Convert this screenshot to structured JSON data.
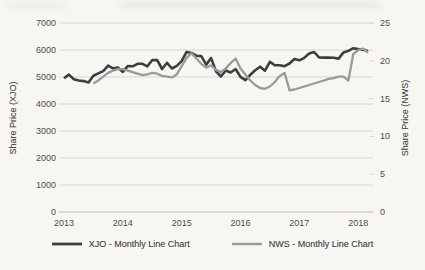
{
  "page": {
    "background": "#f7f6f3"
  },
  "colors": {
    "grid": "#d7d6d2",
    "axis_line": "#bdbcb8",
    "tick_text": "#4d4d4d",
    "xjo_line": "#3e3e3e",
    "nws_line": "#9b9a98"
  },
  "chart_data": {
    "type": "line",
    "title": "",
    "categories": [
      "Jan 2013",
      "Feb 2013",
      "Mar 2013",
      "Apr 2013",
      "May 2013",
      "Jun 2013",
      "Jul 2013",
      "Aug 2013",
      "Sep 2013",
      "Oct 2013",
      "Nov 2013",
      "Dec 2013",
      "Jan 2014",
      "Feb 2014",
      "Mar 2014",
      "Apr 2014",
      "May 2014",
      "Jun 2014",
      "Jul 2014",
      "Aug 2014",
      "Sep 2014",
      "Oct 2014",
      "Nov 2014",
      "Dec 2014",
      "Jan 2015",
      "Feb 2015",
      "Mar 2015",
      "Apr 2015",
      "May 2015",
      "Jun 2015",
      "Jul 2015",
      "Aug 2015",
      "Sep 2015",
      "Oct 2015",
      "Nov 2015",
      "Dec 2015",
      "Jan 2016",
      "Feb 2016",
      "Mar 2016",
      "Apr 2016",
      "May 2016",
      "Jun 2016",
      "Jul 2016",
      "Aug 2016",
      "Sep 2016",
      "Oct 2016",
      "Nov 2016",
      "Dec 2016",
      "Jan 2017",
      "Feb 2017",
      "Mar 2017",
      "Apr 2017",
      "May 2017",
      "Jun 2017",
      "Jul 2017",
      "Aug 2017",
      "Sep 2017",
      "Oct 2017",
      "Nov 2017",
      "Dec 2017",
      "Jan 2018",
      "Feb 2018",
      "Mar 2018"
    ],
    "series": [
      {
        "name": "XJO - Monthly Line Chart",
        "axis": "left",
        "color": "#3e3e3e",
        "stroke_width": 2.6,
        "values": [
          4950,
          5090,
          4920,
          4870,
          4850,
          4800,
          5050,
          5135,
          5220,
          5420,
          5320,
          5350,
          5190,
          5405,
          5395,
          5490,
          5490,
          5395,
          5630,
          5625,
          5295,
          5525,
          5315,
          5410,
          5590,
          5930,
          5890,
          5790,
          5775,
          5460,
          5700,
          5210,
          5020,
          5240,
          5165,
          5295,
          5005,
          4880,
          5080,
          5250,
          5380,
          5235,
          5560,
          5435,
          5435,
          5400,
          5500,
          5665,
          5620,
          5710,
          5865,
          5925,
          5725,
          5720,
          5720,
          5715,
          5680,
          5910,
          5970,
          6065,
          6035,
          6015,
          5950
        ]
      },
      {
        "name": "NWS - Monthly Line Chart",
        "axis": "right",
        "color": "#9b9a98",
        "stroke_width": 2.3,
        "values": [
          null,
          null,
          null,
          null,
          null,
          null,
          17.0,
          17.4,
          17.9,
          18.4,
          18.7,
          18.9,
          18.9,
          18.7,
          18.5,
          18.3,
          18.1,
          18.2,
          18.4,
          18.3,
          18.0,
          17.9,
          17.8,
          18.2,
          19.3,
          20.4,
          21.0,
          20.3,
          19.6,
          19.1,
          19.4,
          18.8,
          18.5,
          19.0,
          19.7,
          20.3,
          19.0,
          18.2,
          17.4,
          16.8,
          16.4,
          16.3,
          16.6,
          17.2,
          18.0,
          18.4,
          16.1,
          16.2,
          16.4,
          16.6,
          16.8,
          17.0,
          17.2,
          17.4,
          17.6,
          17.7,
          17.9,
          17.9,
          17.4,
          20.9,
          21.4,
          21.6,
          21.1
        ]
      }
    ],
    "left_axis": {
      "title": "Share Price (XJO)",
      "min": 0,
      "max": 7000,
      "ticks": [
        0,
        1000,
        2000,
        3000,
        4000,
        5000,
        6000,
        7000
      ]
    },
    "right_axis": {
      "title": "Share Price (NWS)",
      "min": 0,
      "max": 25,
      "ticks": [
        0,
        5,
        10,
        15,
        20,
        25
      ]
    },
    "x_axis": {
      "tick_labels": [
        "2013",
        "2014",
        "2015",
        "2016",
        "2017",
        "2018"
      ]
    },
    "grid": {
      "horizontal": true,
      "vertical": false
    },
    "legend": {
      "position": "bottom"
    }
  }
}
